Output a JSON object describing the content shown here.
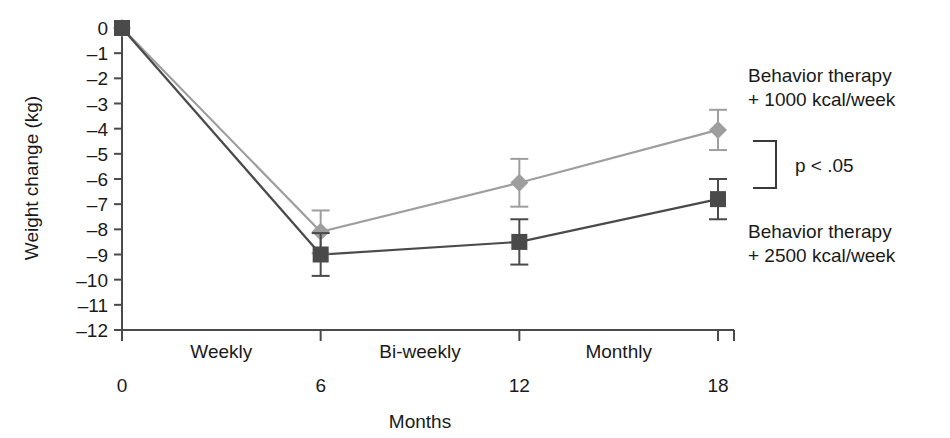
{
  "chart_data": {
    "type": "line",
    "title": "",
    "xlabel": "Months",
    "ylabel": "Weight change (kg)",
    "x": [
      0,
      6,
      12,
      18
    ],
    "xticklabels": [
      "0",
      "6",
      "12",
      "18"
    ],
    "xlim": [
      0,
      18
    ],
    "ylim": [
      -12,
      0
    ],
    "yticks": [
      0,
      -1,
      -2,
      -3,
      -4,
      -5,
      -6,
      -7,
      -8,
      -9,
      -10,
      -11,
      -12
    ],
    "yticklabels": [
      "0",
      "–1",
      "–2",
      "–3",
      "–4",
      "–5",
      "–6",
      "–7",
      "–8",
      "–9",
      "–10",
      "–11",
      "–12"
    ],
    "grid": false,
    "legend_position": "right",
    "series": [
      {
        "name": "Behavior therapy + 1000 kcal/week",
        "marker": "diamond",
        "color": "#9e9e9e",
        "values": [
          0,
          -8.1,
          -6.15,
          -4.05
        ],
        "errors": [
          0,
          0.85,
          0.95,
          0.8
        ]
      },
      {
        "name": "Behavior therapy + 2500 kcal/week",
        "marker": "square",
        "color": "#4a4a4a",
        "values": [
          0,
          -9.0,
          -8.5,
          -6.8
        ],
        "errors": [
          0,
          0.85,
          0.9,
          0.8
        ]
      }
    ],
    "phase_annotations": [
      {
        "label": "Weekly",
        "x_center": 3
      },
      {
        "label": "Bi-weekly",
        "x_center": 9
      },
      {
        "label": "Monthly",
        "x_center": 15
      }
    ],
    "significance_annotation": "p < .05"
  },
  "legend": {
    "upper_line1": "Behavior therapy",
    "upper_line2": "+ 1000 kcal/week",
    "lower_line1": "Behavior therapy",
    "lower_line2": "+ 2500 kcal/week",
    "pvalue": "p < .05"
  },
  "axes": {
    "ylabel": "Weight change (kg)",
    "xlabel": "Months"
  },
  "colors": {
    "series_light": "#9e9e9e",
    "series_dark": "#4a4a4a",
    "axis": "#4a4a4a",
    "text": "#1a1a1a",
    "background": "#ffffff"
  }
}
